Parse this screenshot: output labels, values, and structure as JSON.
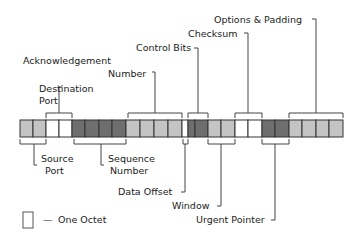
{
  "diagram": {
    "colors": {
      "light": "#c4c4c4",
      "white": "#ffffff",
      "dark": "#6e6e6e"
    },
    "fields": [
      {
        "name": "Source Port",
        "octets": 2,
        "shade": "light",
        "label_side": "bottom"
      },
      {
        "name": "Destination Port",
        "octets": 2,
        "shade": "white",
        "label_side": "top"
      },
      {
        "name": "Sequence Number",
        "octets": 4,
        "shade": "dark",
        "label_side": "bottom"
      },
      {
        "name": "Acknowledgement Number",
        "octets": 4,
        "shade": "light",
        "label_side": "top"
      },
      {
        "name": "Data Offset",
        "octets": 0.5,
        "shade": "white",
        "label_side": "bottom"
      },
      {
        "name": "Control Bits",
        "octets": 1.5,
        "shade": "dark",
        "label_side": "top"
      },
      {
        "name": "Window",
        "octets": 2,
        "shade": "light",
        "label_side": "bottom"
      },
      {
        "name": "Checksum",
        "octets": 2,
        "shade": "white",
        "label_side": "top"
      },
      {
        "name": "Urgent Pointer",
        "octets": 2,
        "shade": "dark",
        "label_side": "bottom"
      },
      {
        "name": "Options & Padding",
        "octets": 4,
        "shade": "light",
        "label_side": "top"
      }
    ],
    "labels": {
      "source_port_1": "Source",
      "source_port_2": "Port",
      "destination_port_1": "Destination",
      "destination_port_2": "Port",
      "sequence_number_1": "Sequence",
      "sequence_number_2": "Number",
      "acknowledgement_number_1": "Acknowledgement",
      "acknowledgement_number_2": "Number",
      "data_offset": "Data Offset",
      "control_bits": "Control Bits",
      "window": "Window",
      "checksum": "Checksum",
      "urgent_pointer": "Urgent Pointer",
      "options_padding": "Options & Padding"
    },
    "legend": {
      "symbol": "empty-octet-box",
      "dash": "—",
      "text": "One Octet"
    }
  }
}
